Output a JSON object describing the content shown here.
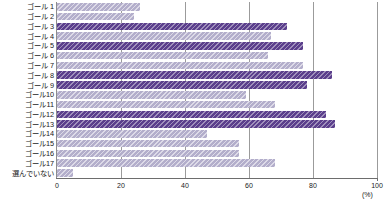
{
  "chart_data": {
    "type": "bar",
    "orientation": "horizontal",
    "title": "",
    "xlabel": "(%)",
    "ylabel": "",
    "xlim": [
      0,
      100
    ],
    "xticks": [
      0,
      20,
      40,
      60,
      80,
      100
    ],
    "xtick_labels": [
      "0",
      "20",
      "40",
      "60",
      "80",
      "100"
    ],
    "grid": true,
    "grid_axis": "x",
    "legend": "none",
    "categories": [
      "ゴール 1",
      "ゴール 2",
      "ゴール 3",
      "ゴール 4",
      "ゴール 5",
      "ゴール 6",
      "ゴール 7",
      "ゴール 8",
      "ゴール 9",
      "ゴール10",
      "ゴール11",
      "ゴール12",
      "ゴール13",
      "ゴール14",
      "ゴール15",
      "ゴール16",
      "ゴール17",
      "選んでいない"
    ],
    "values": [
      26,
      24,
      72,
      67,
      77,
      66,
      77,
      86,
      78,
      59,
      68,
      84,
      87,
      47,
      57,
      57,
      68,
      5
    ],
    "highlighted": [
      false,
      false,
      true,
      false,
      true,
      false,
      false,
      true,
      true,
      false,
      false,
      true,
      true,
      false,
      false,
      false,
      false,
      false
    ],
    "colors": {
      "bar_light": "#b3aecb",
      "bar_dark": "#5b3f8c",
      "gridline": "#9b9b9b",
      "axis": "#6d6d6d",
      "text": "#1a1a1a",
      "background": "#ffffff"
    }
  },
  "axis": {
    "unit": "(%)"
  },
  "caption": {
    "text": ""
  }
}
